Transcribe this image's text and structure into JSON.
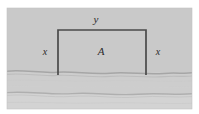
{
  "figure": {
    "canvas": {
      "width": 199,
      "height": 114
    },
    "panel": {
      "x": 7,
      "y": 8,
      "width": 185,
      "height": 101,
      "fill_upper": "#c9c9c9",
      "fill_lower": "#cfcfcf",
      "fill_lowest": "#d2d2d2"
    },
    "enclosure": {
      "left_x": 58,
      "right_x": 146,
      "top_y": 30,
      "bottom_y": 75,
      "stroke": "#4a4a4a",
      "stroke_width": 1.6,
      "fill": "none"
    },
    "ground_lines": [
      {
        "name": "bank-line-upper",
        "y": 73,
        "stroke": "#a8a8a8",
        "stroke_width": 1.4
      },
      {
        "name": "bank-line-lower",
        "y": 94,
        "stroke": "#b0b0b0",
        "stroke_width": 1.3
      }
    ],
    "labels": {
      "top_side": "y",
      "left_side": "x",
      "right_side": "x",
      "area": "A"
    }
  }
}
